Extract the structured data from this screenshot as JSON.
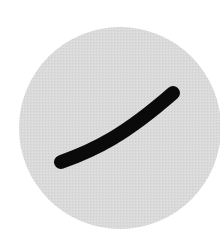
{
  "figure": {
    "background": "#ffffff",
    "circle": {
      "cx": 120,
      "cy": 128,
      "r": 101,
      "fill": "#d9d9d9"
    },
    "stroke": {
      "path": "M61 162 C 95 150, 125 135, 173 93",
      "color": "#0a0a0a",
      "width": 14,
      "cap": "round"
    }
  }
}
